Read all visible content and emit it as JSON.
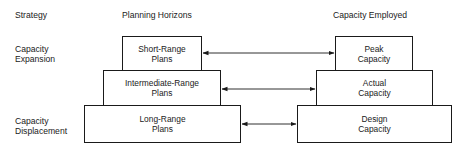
{
  "headers": {
    "strategy": "Strategy",
    "planning_horizons": "Planning Horizons",
    "capacity_employed": "Capacity Employed"
  },
  "strategies": [
    {
      "line1": "Capacity",
      "line2": "Expansion"
    },
    {
      "line1": "Capacity",
      "line2": "Displacement"
    }
  ],
  "plans": [
    {
      "line1": "Short-Range",
      "line2": "Plans"
    },
    {
      "line1": "Intermediate-Range",
      "line2": "Plans"
    },
    {
      "line1": "Long-Range",
      "line2": "Plans"
    }
  ],
  "capacities": [
    {
      "line1": "Peak",
      "line2": "Capacity"
    },
    {
      "line1": "Actual",
      "line2": "Capacity"
    },
    {
      "line1": "Design",
      "line2": "Capacity"
    }
  ],
  "connections": [
    {
      "from": "Short-Range Plans",
      "to": "Peak Capacity",
      "direction": "both"
    },
    {
      "from": "Intermediate-Range Plans",
      "to": "Actual Capacity",
      "direction": "both"
    },
    {
      "from": "Long-Range Plans",
      "to": "Design Capacity",
      "direction": "both"
    }
  ]
}
